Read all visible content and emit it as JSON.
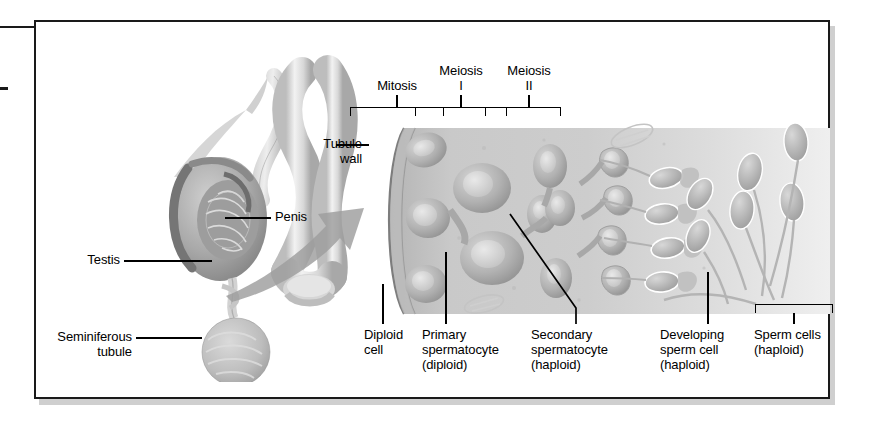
{
  "figure": {
    "frame_color": "#1a1a1a",
    "background": "#ffffff"
  },
  "anatomy_labels": [
    {
      "id": "penis",
      "text": "Penis"
    },
    {
      "id": "testis",
      "text": "Testis"
    },
    {
      "id": "seminiferous-tubule",
      "text": "Seminiferous\ntubule"
    }
  ],
  "tubule_labels": [
    {
      "id": "tubule-wall",
      "text": "Tubule\nwall"
    }
  ],
  "stage_brackets": [
    {
      "id": "mitosis",
      "text": "Mitosis"
    },
    {
      "id": "meiosis-i",
      "text": "Meiosis\nI"
    },
    {
      "id": "meiosis-ii",
      "text": "Meiosis\nII"
    }
  ],
  "cell_stage_labels": [
    {
      "id": "diploid-cell",
      "text": "Diploid\ncell"
    },
    {
      "id": "primary-spermatocyte",
      "text": "Primary\nspermatocyte\n(diploid)"
    },
    {
      "id": "secondary-spermatocyte",
      "text": "Secondary\nspermatocyte\n(haploid)"
    },
    {
      "id": "developing-sperm-cell",
      "text": "Developing\nsperm cell\n(haploid)"
    },
    {
      "id": "sperm-cells",
      "text": "Sperm cells\n(haploid)"
    }
  ],
  "arrow": {
    "id": "magnify-arrow",
    "description": "curved gray arrow from testis to tubule"
  },
  "colors": {
    "ink": "#000000",
    "frame": "#1a1a1a",
    "arrow_gray": "#9a9a9a",
    "tubule_fill": "#c9c9c9",
    "tubule_light": "#e3e3e3",
    "cell_gray": "#b3b3b3",
    "shadow": "#8c8c8c"
  }
}
